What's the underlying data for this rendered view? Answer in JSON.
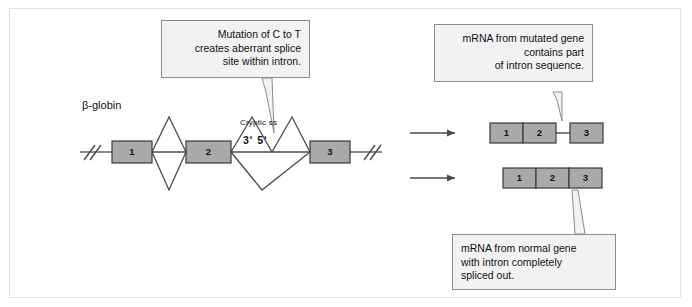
{
  "figure": {
    "gene_label": "β-globin",
    "cryptic_site_label": "Cryptic ss",
    "cryptic_site_ends": "3ʹ 5ʹ"
  },
  "callouts": {
    "mutation": {
      "line1": "Mutation of C to T",
      "line2": "creates aberrant splice",
      "line3": "site within intron."
    },
    "mutant_mrna": {
      "line1": "mRNA from mutated gene",
      "line2": "contains part",
      "line3": "of intron sequence."
    },
    "normal_mrna": {
      "line1": "mRNA from normal gene",
      "line2": "with intron completely",
      "line3": "spliced out."
    }
  },
  "gene": {
    "exons": [
      {
        "label": "1"
      },
      {
        "label": "2"
      },
      {
        "label": "3"
      }
    ]
  },
  "mrna_mutant": {
    "exons": [
      {
        "label": "1"
      },
      {
        "label": "2"
      },
      {
        "label": "3"
      }
    ]
  },
  "mrna_normal": {
    "exons": [
      {
        "label": "1"
      },
      {
        "label": "2"
      },
      {
        "label": "3"
      }
    ]
  },
  "colors": {
    "exon_fill": "#a9a9a9",
    "exon_stroke": "#3a3a3a",
    "callout_fill": "#f2f2f2",
    "callout_stroke": "#8c8c8c",
    "line": "#4a4a4a",
    "frame": "#e3e3e3"
  }
}
